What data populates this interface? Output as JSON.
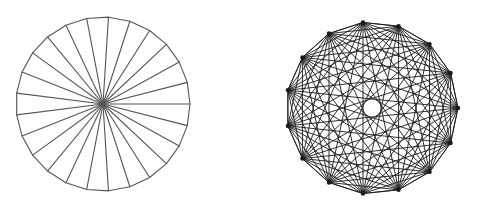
{
  "figures": [
    {
      "id": "spoked-polygon",
      "type": "wheel",
      "vertex_count": 25,
      "center": [
        103,
        104
      ],
      "radius": 87,
      "start_angle_deg": 0,
      "outline": true,
      "spokes_to_center": true,
      "stroke_color": "#555555",
      "stroke_width": 1.1
    },
    {
      "id": "complete-graph",
      "type": "complete-graph",
      "vertex_count": 15,
      "center": [
        372,
        108
      ],
      "radius": 86,
      "start_angle_deg": 0,
      "outline": true,
      "all_chords": true,
      "stroke_color": "#1a1a1a",
      "stroke_width": 0.9,
      "vertex_dot_radius": 2.2
    }
  ],
  "colors": {
    "background": "#ffffff"
  }
}
